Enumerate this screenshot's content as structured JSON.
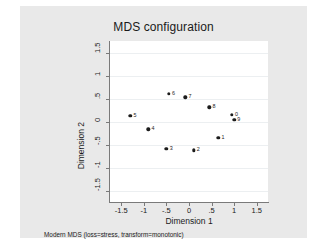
{
  "figure": {
    "background_color": "#e9e9e9",
    "plot_background_color": "#ffffff",
    "note": "Modern MDS (loss=stress, transform=monotonic)"
  },
  "chart_data": {
    "type": "scatter",
    "title": "MDS configuration",
    "xlabel": "Dimension 1",
    "ylabel": "Dimension 2",
    "xlim": [
      -1.75,
      1.75
    ],
    "ylim": [
      -1.75,
      1.75
    ],
    "xticks": [
      "-1.5",
      "-1",
      "-.5",
      "0",
      ".5",
      "1",
      "1.5"
    ],
    "xtick_values": [
      -1.5,
      -1,
      -0.5,
      0,
      0.5,
      1,
      1.5
    ],
    "yticks": [
      "-1.5",
      "-1",
      "-.5",
      "0",
      ".5",
      "1",
      "1.5"
    ],
    "ytick_values": [
      -1.5,
      -1,
      -0.5,
      0,
      0.5,
      1,
      1.5
    ],
    "grid": "horizontal",
    "legend": "none",
    "marker_color": "#1c1c1c",
    "points": [
      {
        "label": "5",
        "x": -1.3,
        "y": 0.13
      },
      {
        "label": "4",
        "x": -0.9,
        "y": -0.17
      },
      {
        "label": "3",
        "x": -0.5,
        "y": -0.6
      },
      {
        "label": "6",
        "x": -0.45,
        "y": 0.6
      },
      {
        "label": "7",
        "x": -0.08,
        "y": 0.53
      },
      {
        "label": "2",
        "x": 0.1,
        "y": -0.63
      },
      {
        "label": "8",
        "x": 0.45,
        "y": 0.31
      },
      {
        "label": "1",
        "x": 0.65,
        "y": -0.35
      },
      {
        "label": "0",
        "x": 0.95,
        "y": 0.14
      },
      {
        "label": "9",
        "x": 1.0,
        "y": 0.04
      }
    ]
  }
}
